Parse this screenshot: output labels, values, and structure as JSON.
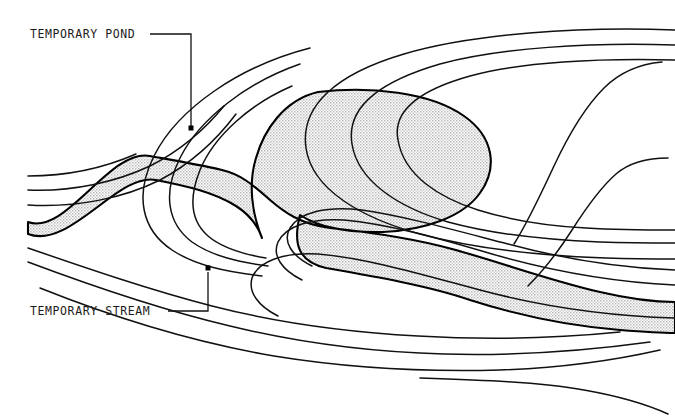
{
  "figure": {
    "type": "topographic-contour-map",
    "width": 675,
    "height": 416,
    "background_color": "#ffffff"
  },
  "annotations": [
    {
      "id": "temporary-pond",
      "label": "TEMPORARY POND",
      "text_x": 30,
      "text_y": 38,
      "leader": {
        "h_start_x": 150,
        "h_y": 34,
        "corner_x": 191,
        "v_end_y": 126
      },
      "dot": {
        "x": 191,
        "y": 128,
        "size": 5
      }
    },
    {
      "id": "temporary-stream",
      "label": "TEMPORARY STREAM",
      "text_x": 30,
      "text_y": 315,
      "leader": {
        "h_start_x": 168,
        "h_y": 311,
        "corner_x": 208,
        "v_end_y": 272
      },
      "dot": {
        "x": 208,
        "y": 268,
        "size": 5
      }
    }
  ],
  "features": [
    {
      "name": "temporary-pond-basin",
      "kind": "water-body-fill",
      "fill_pattern": "stipple",
      "fill_color": "#e6e6e6",
      "outline_color": "#000000",
      "outline_width": 2.1
    },
    {
      "name": "temporary-stream-channel",
      "kind": "water-body-fill",
      "fill_pattern": "stipple",
      "fill_color": "#e6e6e6",
      "outline_color": "#000000",
      "outline_width": 2.1
    }
  ],
  "contours": {
    "line_color": "#111111",
    "line_width": 1.5,
    "count": 16,
    "style": "hand-drawn nested elevation contours"
  },
  "colors": {
    "ink": "#111111",
    "paper": "#ffffff",
    "water_tone": "#e6e6e6",
    "label_ink": "#1a1a1a"
  }
}
